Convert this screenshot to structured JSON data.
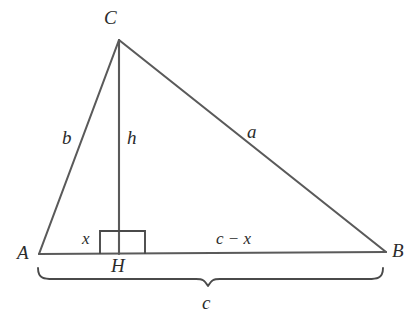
{
  "figure": {
    "kind": "geometry-diagram",
    "background_color": "#ffffff",
    "stroke_color": "#5a5a5a",
    "text_color": "#2b2b2b"
  },
  "vertices": {
    "A": {
      "label": "A",
      "x": 39,
      "y": 254,
      "label_x": 17,
      "label_y": 247
    },
    "B": {
      "label": "B",
      "x": 386,
      "y": 252,
      "label_x": 392,
      "label_y": 245
    },
    "C": {
      "label": "C",
      "x": 119,
      "y": 40,
      "label_x": 104,
      "label_y": 8
    },
    "H": {
      "label": "H",
      "x": 119,
      "y": 254,
      "label_x": 112,
      "label_y": 258
    }
  },
  "sides": [
    {
      "name": "b",
      "label": "b",
      "from": "A",
      "to": "C",
      "label_x": 62,
      "label_y": 131
    },
    {
      "name": "a",
      "label": "a",
      "from": "C",
      "to": "B",
      "label_x": 247,
      "label_y": 124
    },
    {
      "name": "h",
      "label": "h",
      "from": "C",
      "to": "H",
      "label_x": 126,
      "label_y": 131
    }
  ],
  "segments": [
    {
      "name": "AH",
      "label": "x",
      "label_x": 83,
      "label_y": 231
    },
    {
      "name": "HB",
      "label": "c − x",
      "label_x": 215,
      "label_y": 232
    }
  ],
  "right_angle": {
    "at": "H",
    "marker": "right-angle-square",
    "x": 100,
    "y": 231,
    "width": 45,
    "height": 23
  },
  "brace": {
    "label": "c",
    "measures": "AB",
    "left_x": 38,
    "right_x": 383,
    "top_y": 268,
    "tip_x": 208,
    "tip_y": 286,
    "label_x": 202,
    "label_y": 293
  }
}
